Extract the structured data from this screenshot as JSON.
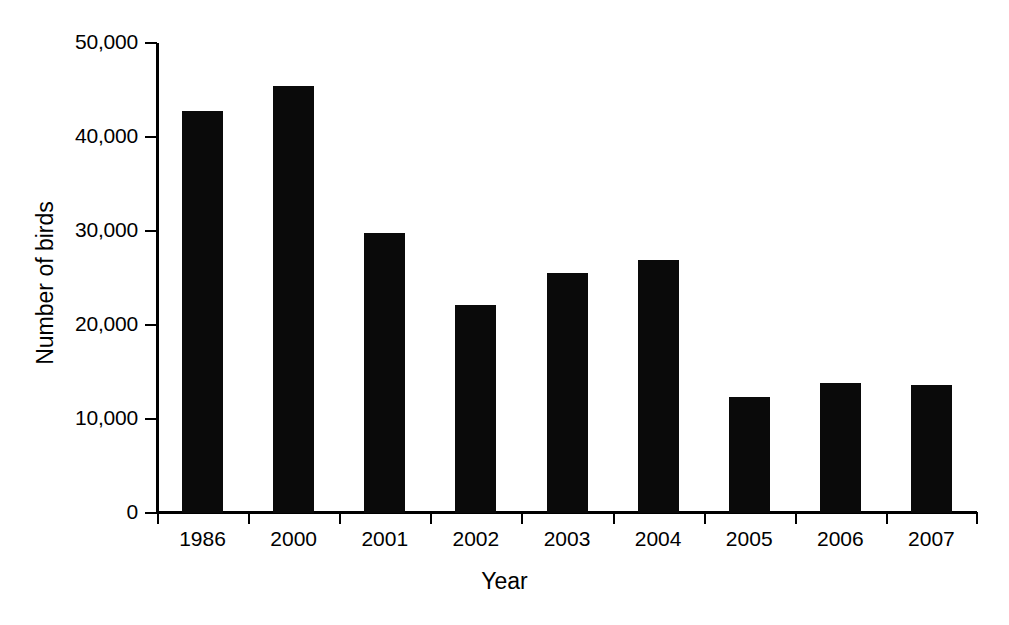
{
  "chart_data": {
    "type": "bar",
    "title": "",
    "subtitle": "",
    "xlabel": "Year",
    "ylabel": "Number of birds",
    "categories": [
      "1986",
      "2000",
      "2001",
      "2002",
      "2003",
      "2004",
      "2005",
      "2006",
      "2007"
    ],
    "values": [
      42800,
      45400,
      29800,
      22100,
      25500,
      26900,
      12300,
      13800,
      13600
    ],
    "series": [
      {
        "name": "Number of birds",
        "values": [
          42800,
          45400,
          29800,
          22100,
          25500,
          26900,
          12300,
          13800,
          13600
        ]
      }
    ],
    "ylim": [
      0,
      50000
    ],
    "ytick_values": [
      0,
      10000,
      20000,
      30000,
      40000,
      50000
    ],
    "ytick_labels": [
      "0",
      "10,000",
      "20,000",
      "30,000",
      "40,000",
      "50,000"
    ],
    "grid": false,
    "legend": false,
    "legend_position": "none",
    "bar_color": "#0a0a0a",
    "background_color": "#ffffff",
    "axis_color": "#000000"
  }
}
